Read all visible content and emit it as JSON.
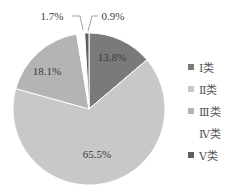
{
  "chart_data": {
    "type": "pie",
    "title": "",
    "categories": [
      "Ⅰ类",
      "Ⅱ类",
      "Ⅲ类",
      "Ⅳ类",
      "Ⅴ类"
    ],
    "values": [
      13.8,
      65.5,
      18.1,
      1.7,
      0.9
    ],
    "labels": [
      "13.8%",
      "65.5%",
      "18.1%",
      "1.7%",
      "0.9%"
    ],
    "colors": [
      "#7a7a7a",
      "#c8c8c8",
      "#b4b4b4",
      "#ffffff",
      "#5e5e5e"
    ],
    "legend_position": "right",
    "start_angle_deg": 0,
    "direction": "clockwise"
  },
  "legend": {
    "items": [
      {
        "label": "Ⅰ类",
        "color": "#7a7a7a"
      },
      {
        "label": "Ⅱ类",
        "color": "#c8c8c8"
      },
      {
        "label": "Ⅲ类",
        "color": "#b4b4b4"
      },
      {
        "label": "Ⅳ类",
        "color": "#ffffff"
      },
      {
        "label": "Ⅴ类",
        "color": "#5e5e5e"
      }
    ]
  }
}
